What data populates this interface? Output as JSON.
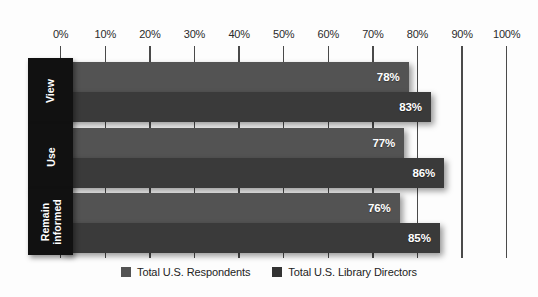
{
  "chart_data": {
    "type": "bar",
    "orientation": "horizontal",
    "title": "",
    "xlabel": "",
    "ylabel": "",
    "xlim": [
      0,
      100
    ],
    "grid": true,
    "legend_position": "bottom-center",
    "categories": [
      "View",
      "Use",
      "Remain informed"
    ],
    "tick_labels": [
      "0%",
      "10%",
      "20%",
      "30%",
      "40%",
      "50%",
      "60%",
      "70%",
      "80%",
      "90%",
      "100%"
    ],
    "tick_values": [
      0,
      10,
      20,
      30,
      40,
      50,
      60,
      70,
      80,
      90,
      100
    ],
    "series": [
      {
        "name": "Total U.S. Respondents",
        "color": "#535353",
        "values": [
          78,
          77,
          76
        ],
        "value_labels": [
          "78%",
          "77%",
          "76%"
        ]
      },
      {
        "name": "Total U.S. Library Directors",
        "color": "#3a3a3a",
        "values": [
          83,
          86,
          85
        ],
        "value_labels": [
          "83%",
          "86%",
          "85%"
        ]
      }
    ]
  },
  "axis": {
    "ticks": [
      {
        "label": "0%",
        "value": 0
      },
      {
        "label": "10%",
        "value": 10
      },
      {
        "label": "20%",
        "value": 20
      },
      {
        "label": "30%",
        "value": 30
      },
      {
        "label": "40%",
        "value": 40
      },
      {
        "label": "50%",
        "value": 50
      },
      {
        "label": "60%",
        "value": 60
      },
      {
        "label": "70%",
        "value": 70
      },
      {
        "label": "80%",
        "value": 80
      },
      {
        "label": "90%",
        "value": 90
      },
      {
        "label": "100%",
        "value": 100
      }
    ]
  },
  "groups": [
    {
      "label": "View",
      "label_lines": [
        "View"
      ],
      "bars": [
        {
          "series": "Total U.S. Respondents",
          "value": 78,
          "value_label": "78%"
        },
        {
          "series": "Total U.S. Library Directors",
          "value": 83,
          "value_label": "83%"
        }
      ]
    },
    {
      "label": "Use",
      "label_lines": [
        "Use"
      ],
      "bars": [
        {
          "series": "Total U.S. Respondents",
          "value": 77,
          "value_label": "77%"
        },
        {
          "series": "Total U.S. Library Directors",
          "value": 86,
          "value_label": "86%"
        }
      ]
    },
    {
      "label": "Remain informed",
      "label_lines": [
        "Remain",
        "informed"
      ],
      "bars": [
        {
          "series": "Total U.S. Respondents",
          "value": 76,
          "value_label": "76%"
        },
        {
          "series": "Total U.S. Library Directors",
          "value": 85,
          "value_label": "85%"
        }
      ]
    }
  ],
  "legend": {
    "items": [
      {
        "label": "Total U.S. Respondents",
        "color": "#535353"
      },
      {
        "label": "Total U.S. Library Directors",
        "color": "#333333"
      }
    ]
  },
  "colors": {
    "series_1": "#535353",
    "series_2": "#3a3a3a",
    "label_box": "#111111",
    "gridline": "#4a4a4a",
    "background": "#fdfdfd",
    "axis_text": "#2b2b2b"
  }
}
